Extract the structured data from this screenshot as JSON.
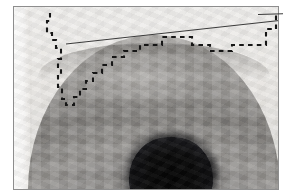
{
  "figure": {
    "title": "",
    "caption": "",
    "kind": "grayscale-medical-image",
    "width_px": 283,
    "height_px": 196
  },
  "image_panel": {
    "name": "grayscale-image-panel",
    "frame_border_color": "#8d8d8d",
    "background_color": "#efeeec",
    "left_px": 13,
    "top_px": 6,
    "width_px": 264,
    "height_px": 182
  },
  "features": {
    "dome": {
      "name": "bright-dome-structure",
      "description": "pixelated dome-shaped mid-gray region occupying lower two thirds of frame",
      "fill_color_light": "#b0aeab",
      "fill_color_dark": "#6e6c69"
    },
    "dark_blob": {
      "name": "dark-elliptical-region",
      "description": "near-black rounded region at bottom center of the dome",
      "fill_color": "#0b0b0b",
      "center_x_px": 170,
      "center_y_px": 172,
      "width_px": 84,
      "height_px": 70
    },
    "left_strip": {
      "name": "bright-left-margin-strip",
      "fill_color": "#fbfbfa"
    }
  },
  "annotations": {
    "contour": {
      "name": "dashed-contour-overlay",
      "style": "dashed",
      "color": "#161616",
      "stroke_width": 2.1,
      "dash_pattern": "4.6 4.2",
      "description": "stepped dashed boundary traced around the dome and along the top of the frame",
      "points": [
        [
          36,
          6
        ],
        [
          36,
          14
        ],
        [
          33,
          14
        ],
        [
          33,
          26
        ],
        [
          38,
          26
        ],
        [
          38,
          33
        ],
        [
          42,
          33
        ],
        [
          42,
          41
        ],
        [
          47,
          41
        ],
        [
          47,
          52
        ],
        [
          44,
          52
        ],
        [
          44,
          60
        ],
        [
          47,
          60
        ],
        [
          47,
          68
        ],
        [
          44,
          68
        ],
        [
          44,
          80
        ],
        [
          48,
          80
        ],
        [
          48,
          92
        ],
        [
          52,
          92
        ],
        [
          52,
          98
        ],
        [
          60,
          98
        ],
        [
          60,
          90
        ],
        [
          66,
          90
        ],
        [
          66,
          82
        ],
        [
          72,
          82
        ],
        [
          72,
          74
        ],
        [
          79,
          74
        ],
        [
          79,
          66
        ],
        [
          88,
          66
        ],
        [
          88,
          58
        ],
        [
          98,
          58
        ],
        [
          98,
          50
        ],
        [
          110,
          50
        ],
        [
          110,
          44
        ],
        [
          126,
          44
        ],
        [
          126,
          38
        ],
        [
          148,
          38
        ],
        [
          148,
          30
        ],
        [
          178,
          30
        ],
        [
          178,
          38
        ],
        [
          196,
          38
        ],
        [
          196,
          44
        ],
        [
          218,
          44
        ],
        [
          218,
          38
        ],
        [
          252,
          38
        ],
        [
          252,
          22
        ],
        [
          262,
          22
        ],
        [
          262,
          6
        ]
      ]
    },
    "reference_line": {
      "name": "solid-reference-line",
      "style": "solid",
      "color": "#3a3a3a",
      "stroke_width": 1,
      "description": "thin straight line rising from left of dome apex to beyond the right frame edge",
      "x1_px": 52,
      "y1_px": 37,
      "x2_px": 283,
      "y2_px": 13
    }
  }
}
